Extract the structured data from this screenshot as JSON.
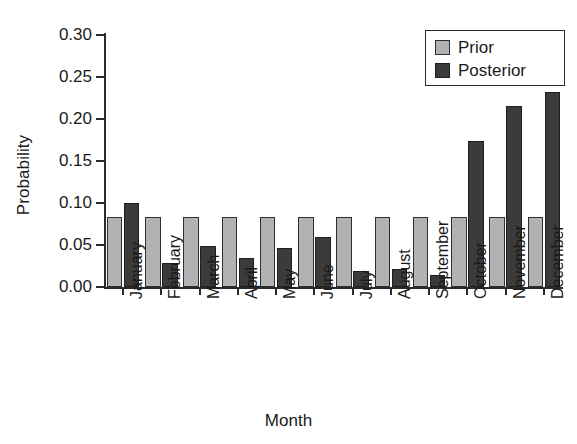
{
  "chart_data": {
    "type": "bar",
    "title": "",
    "xlabel": "Month",
    "ylabel": "Probability",
    "categories": [
      "January",
      "February",
      "March",
      "April",
      "May",
      "June",
      "July",
      "August",
      "September",
      "October",
      "November",
      "December"
    ],
    "series": [
      {
        "name": "Prior",
        "color": "#b2b2b2",
        "values": [
          0.083,
          0.083,
          0.083,
          0.083,
          0.083,
          0.083,
          0.083,
          0.083,
          0.083,
          0.083,
          0.083,
          0.083
        ]
      },
      {
        "name": "Posterior",
        "color": "#3b3b3b",
        "values": [
          0.1,
          0.029,
          0.049,
          0.034,
          0.046,
          0.059,
          0.019,
          0.022,
          0.014,
          0.174,
          0.215,
          0.232
        ]
      }
    ],
    "ylim": [
      0.0,
      0.3
    ],
    "yticks": [
      0.0,
      0.05,
      0.1,
      0.15,
      0.2,
      0.25,
      0.3
    ],
    "ytick_labels": [
      "0.00",
      "0.05",
      "0.10",
      "0.15",
      "0.20",
      "0.25",
      "0.30"
    ],
    "grid": false,
    "legend_position": "top-right",
    "legend_entries": [
      "Prior",
      "Posterior"
    ]
  },
  "axes": {
    "y_title": "Probability",
    "x_title": "Month"
  },
  "legend": {
    "items": [
      {
        "label": "Prior",
        "swatch": "prior-swatch"
      },
      {
        "label": "Posterior",
        "swatch": "posterior-swatch"
      }
    ]
  }
}
